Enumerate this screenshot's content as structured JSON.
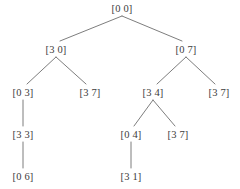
{
  "diagram": {
    "type": "tree",
    "title": "",
    "node_label_format": "[a b]",
    "background_color": "#ffffff",
    "text_color": "#3c3c3c",
    "edge_color": "#6e6e6e",
    "edge_width": 0.9,
    "nodes": [
      {
        "id": "n0",
        "label": "[0 0]",
        "level": 0,
        "x": 122,
        "y": 8
      },
      {
        "id": "n1",
        "label": "[3 0]",
        "level": 1,
        "x": 56,
        "y": 49
      },
      {
        "id": "n2",
        "label": "[0 7]",
        "level": 1,
        "x": 186,
        "y": 49
      },
      {
        "id": "n3",
        "label": "[0 3]",
        "level": 2,
        "x": 23,
        "y": 92
      },
      {
        "id": "n4",
        "label": "[3 7]",
        "level": 2,
        "x": 90,
        "y": 92
      },
      {
        "id": "n5",
        "label": "[3 4]",
        "level": 2,
        "x": 153,
        "y": 92
      },
      {
        "id": "n6",
        "label": "[3 7]",
        "level": 2,
        "x": 219,
        "y": 92
      },
      {
        "id": "n7",
        "label": "[3 3]",
        "level": 3,
        "x": 23,
        "y": 134
      },
      {
        "id": "n8",
        "label": "[0 4]",
        "level": 3,
        "x": 131,
        "y": 134
      },
      {
        "id": "n9",
        "label": "[3 7]",
        "level": 3,
        "x": 178,
        "y": 134
      },
      {
        "id": "n10",
        "label": "[0 6]",
        "level": 4,
        "x": 23,
        "y": 176
      },
      {
        "id": "n11",
        "label": "[3 1]",
        "level": 4,
        "x": 131,
        "y": 176
      }
    ],
    "edges": [
      {
        "from": "n0",
        "to": "n1",
        "x1": 122,
        "y1": 16,
        "x2": 60,
        "y2": 41
      },
      {
        "from": "n0",
        "to": "n2",
        "x1": 122,
        "y1": 16,
        "x2": 182,
        "y2": 41
      },
      {
        "from": "n1",
        "to": "n3",
        "x1": 56,
        "y1": 57,
        "x2": 27,
        "y2": 84
      },
      {
        "from": "n1",
        "to": "n4",
        "x1": 56,
        "y1": 57,
        "x2": 86,
        "y2": 84
      },
      {
        "from": "n2",
        "to": "n5",
        "x1": 186,
        "y1": 57,
        "x2": 157,
        "y2": 84
      },
      {
        "from": "n2",
        "to": "n6",
        "x1": 186,
        "y1": 57,
        "x2": 215,
        "y2": 84
      },
      {
        "from": "n3",
        "to": "n7",
        "x1": 23,
        "y1": 100,
        "x2": 23,
        "y2": 126
      },
      {
        "from": "n5",
        "to": "n8",
        "x1": 153,
        "y1": 100,
        "x2": 134,
        "y2": 126
      },
      {
        "from": "n5",
        "to": "n9",
        "x1": 153,
        "y1": 100,
        "x2": 175,
        "y2": 126
      },
      {
        "from": "n7",
        "to": "n10",
        "x1": 23,
        "y1": 142,
        "x2": 23,
        "y2": 168
      },
      {
        "from": "n8",
        "to": "n11",
        "x1": 131,
        "y1": 142,
        "x2": 131,
        "y2": 168
      }
    ]
  }
}
